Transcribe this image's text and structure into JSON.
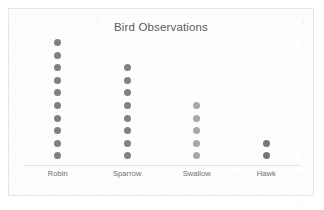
{
  "chart_data": {
    "type": "scatter",
    "title": "Bird Observations",
    "xlabel": "",
    "ylabel": "",
    "categories": [
      "Robin",
      "Sparrow",
      "Swallow",
      "Hawk"
    ],
    "values": [
      10,
      8,
      5,
      2
    ],
    "ylim": [
      0,
      10
    ],
    "grid": false,
    "legend": "none",
    "plot_style": "dot-plot",
    "note": "Each dot represents one observation; dots stack vertically above each category.",
    "series": [
      {
        "name": "Robin",
        "count": 10,
        "color": "#808080"
      },
      {
        "name": "Sparrow",
        "count": 8,
        "color": "#828282"
      },
      {
        "name": "Swallow",
        "count": 5,
        "color": "#a8a8a8"
      },
      {
        "name": "Hawk",
        "count": 2,
        "color": "#767676"
      }
    ]
  },
  "colors": {
    "frame_border": "#e6e6e6",
    "axis_line": "#e4e4e4",
    "title_text": "#5a5a5a",
    "label_text": "#6e6e6e",
    "background": "#fdfdfd"
  }
}
